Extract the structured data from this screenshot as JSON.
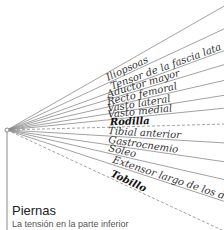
{
  "section": {
    "title": "Piernas",
    "subtitle": "La tensión en la parte inferior"
  },
  "colors": {
    "line": "#8a8a8a",
    "text": "#333333"
  },
  "origin": {
    "x": 7,
    "y": 130
  },
  "rays": [
    {
      "label": "",
      "end_y": 5,
      "dashed": false,
      "bold": false
    },
    {
      "label": "Iliopsoas",
      "end_y": 28,
      "dashed": false,
      "bold": false
    },
    {
      "label": "Tensor de la fascia lata",
      "end_y": 50,
      "dashed": false,
      "bold": false
    },
    {
      "label": "Aductor mayor",
      "end_y": 64,
      "dashed": false,
      "bold": false
    },
    {
      "label": "Recto femoral",
      "end_y": 80,
      "dashed": false,
      "bold": false
    },
    {
      "label": "Vasto lateral",
      "end_y": 95,
      "dashed": false,
      "bold": false
    },
    {
      "label": "Vasto medial",
      "end_y": 108,
      "dashed": false,
      "bold": false
    },
    {
      "label": "Rodilla",
      "end_y": 124,
      "dashed": true,
      "bold": true
    },
    {
      "label": "Tibial anterior",
      "end_y": 143,
      "dashed": false,
      "bold": false
    },
    {
      "label": "Gastrocnemio",
      "end_y": 162,
      "dashed": false,
      "bold": false
    },
    {
      "label": "Sóleo",
      "end_y": 180,
      "dashed": false,
      "bold": false
    },
    {
      "label": "Extensor largo de los dedos",
      "end_y": 202,
      "dashed": false,
      "bold": false
    },
    {
      "label": "Tobillo",
      "end_y": 232,
      "dashed": true,
      "bold": true
    }
  ]
}
